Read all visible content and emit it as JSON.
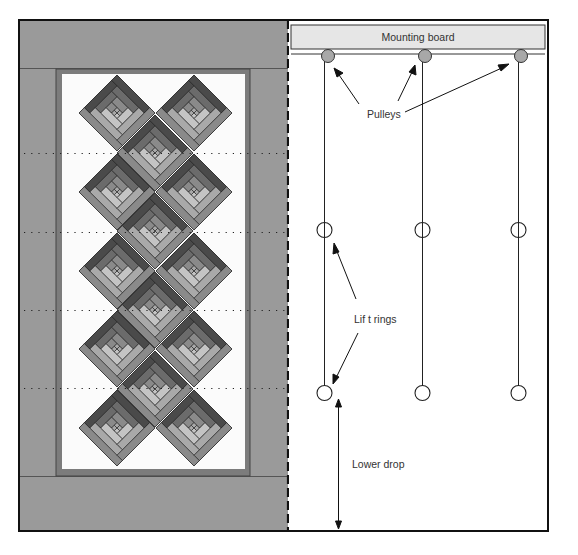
{
  "diagram": {
    "type": "quilt-hanging-diagram",
    "left_panel": {
      "name": "quilt-front-view",
      "pattern": "log-cabin-on-point",
      "block_count": 14,
      "columns": {
        "left_x": 117,
        "middle_x": 155,
        "right_x": 194
      },
      "row_y": [
        113,
        153,
        192,
        231,
        271,
        310,
        349,
        389,
        428
      ],
      "block_half_diagonal": 38,
      "dotted_line_y": [
        153,
        232,
        310,
        388
      ]
    },
    "right_panel": {
      "name": "quilt-back-view",
      "mounting_board": {
        "label": "Mounting board"
      },
      "pulleys": {
        "label": "Pulleys",
        "count": 3,
        "x": [
          328,
          425,
          521
        ],
        "y": 56
      },
      "cords_x": [
        324,
        422,
        518
      ],
      "lift_rings": {
        "label": "Lif t rings",
        "rows_y": [
          230,
          393
        ]
      },
      "lower_drop": {
        "label": "Lower drop"
      }
    }
  },
  "colors": {
    "border_gray": "#9a9a9a",
    "inner_frame": "#7c7c7c",
    "panel_white": "#fbfbfb",
    "board_fill": "#e6e6e6",
    "pulley_fill": "#a8a8a8",
    "outline": "#1a1a1a",
    "log_dark": "#4a4a4a",
    "log_mid_dark": "#6b6b6b",
    "log_mid": "#8a8a8a",
    "log_light": "#a9a9a9",
    "log_lightest": "#c4c4c4"
  }
}
